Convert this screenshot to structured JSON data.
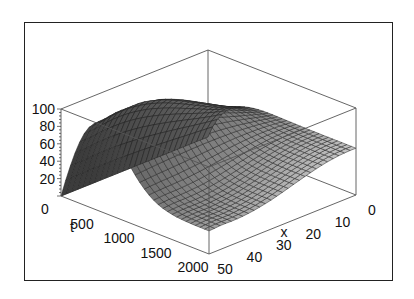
{
  "chart_data": {
    "type": "surface3d",
    "title": "",
    "xlabel": "x",
    "ylabel": "t",
    "zlabel": "",
    "x_ticks": [
      "0",
      "10",
      "20",
      "30",
      "40",
      "50"
    ],
    "t_ticks": [
      "0",
      "500",
      "1000",
      "1500",
      "2000"
    ],
    "z_ticks": [
      "20",
      "40",
      "60",
      "80",
      "100"
    ],
    "xlim": [
      0,
      50
    ],
    "tlim": [
      0,
      2000
    ],
    "zlim": [
      0,
      100
    ],
    "grid": false,
    "legend": null,
    "surface_description": "Mesh surface starting near 0 at t=0,x=50; rising to a peak of ~100 around t≈500 near x=50, then decaying and flattening to ~55-65 toward t=2000 and x=0.",
    "surface_samples": {
      "t": [
        0,
        500,
        1000,
        1500,
        2000
      ],
      "x": [
        0,
        10,
        20,
        30,
        40,
        50
      ],
      "z": [
        [
          0,
          20,
          35,
          30,
          20,
          0
        ],
        [
          60,
          80,
          95,
          100,
          90,
          60
        ],
        [
          60,
          70,
          78,
          80,
          75,
          62
        ],
        [
          58,
          62,
          66,
          68,
          66,
          60
        ],
        [
          55,
          58,
          60,
          62,
          60,
          55
        ]
      ]
    }
  },
  "axes": {
    "x_label": "x",
    "t_label": "t"
  }
}
